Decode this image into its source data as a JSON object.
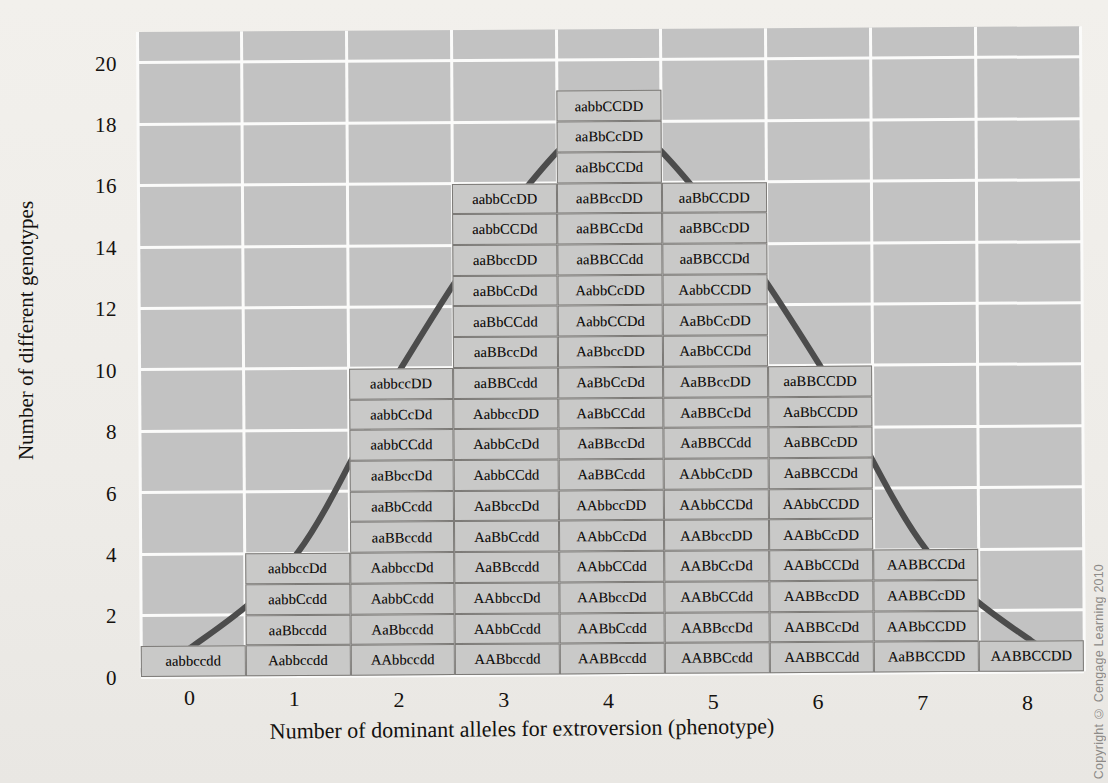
{
  "chart_data": {
    "type": "bar",
    "title": "",
    "xlabel": "Number of dominant alleles for extroversion (phenotype)",
    "ylabel": "Number of different genotypes",
    "categories": [
      "0",
      "1",
      "2",
      "3",
      "4",
      "5",
      "6",
      "7",
      "8"
    ],
    "values": [
      1,
      4,
      10,
      15,
      18,
      15,
      10,
      4,
      1
    ],
    "ylim": [
      0,
      21
    ],
    "xlim": [
      -0.5,
      8.5
    ],
    "yticks": [
      "0",
      "2",
      "4",
      "6",
      "8",
      "10",
      "12",
      "14",
      "16",
      "18",
      "20"
    ],
    "ytick_values": [
      0,
      2,
      4,
      6,
      8,
      10,
      12,
      14,
      16,
      18,
      20
    ],
    "grid": true,
    "legend": null,
    "overlay": "normal-distribution-curve",
    "annotations": "Each cell in a stacked column is one genotype (4 gene loci A,B,C,D) producing that phenotype; stack height = number of different genotypes.",
    "columns": [
      {
        "x": "0",
        "count": 1,
        "genotypes": [
          "aabbccdd"
        ]
      },
      {
        "x": "1",
        "count": 4,
        "genotypes": [
          "Aabbccdd",
          "aaBbccdd",
          "aabbCcdd",
          "aabbccDd"
        ]
      },
      {
        "x": "2",
        "count": 10,
        "genotypes": [
          "AAbbccdd",
          "AaBbccdd",
          "AabbCcdd",
          "AabbccDd",
          "aaBBccdd",
          "aaBbCcdd",
          "aaBbccDd",
          "aabbCCdd",
          "aabbCcDd",
          "aabbccDD"
        ]
      },
      {
        "x": "3",
        "count": 15,
        "genotypes": [
          "AABbccdd",
          "AAbbCcdd",
          "AAbbccDd",
          "AaBBccdd",
          "AaBbCcdd",
          "AaBbccDd",
          "AabbCCdd",
          "AabbCcDd",
          "AabbccDD",
          "aaBBCcdd",
          "aaBBccDd",
          "aaBbCCdd",
          "aaBbCcDd",
          "aaBbccDD",
          "aabbCCDd",
          "aabbCcDD"
        ]
      },
      {
        "x": "4",
        "count": 18,
        "genotypes": [
          "AABBccdd",
          "AABbCcdd",
          "AABbccDd",
          "AAbbCCdd",
          "AAbbCcDd",
          "AAbbccDD",
          "AaBBCcdd",
          "AaBBccDd",
          "AaBbCCdd",
          "AaBbCcDd",
          "AaBbccDD",
          "AabbCCDd",
          "AabbCcDD",
          "aaBBCCdd",
          "aaBBCcDd",
          "aaBBccDD",
          "aaBbCCDd",
          "aaBbCcDD",
          "aabbCCDD"
        ]
      },
      {
        "x": "5",
        "count": 15,
        "genotypes": [
          "AABBCcdd",
          "AABBccDd",
          "AABbCCdd",
          "AABbCcDd",
          "AABbccDD",
          "AAbbCCDd",
          "AAbbCcDD",
          "AaBBCCdd",
          "AaBBCcDd",
          "AaBBccDD",
          "AaBbCCDd",
          "AaBbCcDD",
          "AabbCCDD",
          "aaBBCCDd",
          "aaBBCcDD",
          "aaBbCCDD"
        ]
      },
      {
        "x": "6",
        "count": 10,
        "genotypes": [
          "AABBCCdd",
          "AABBCcDd",
          "AABBccDD",
          "AABbCCDd",
          "AABbCcDD",
          "AAbbCCDD",
          "AaBBCCDd",
          "AaBBCcDD",
          "AaBbCCDD",
          "aaBBCCDD"
        ]
      },
      {
        "x": "7",
        "count": 4,
        "genotypes": [
          "AaBBCCDD",
          "AABbCCDD",
          "AABBCcDD",
          "AABBCCDd"
        ]
      },
      {
        "x": "8",
        "count": 1,
        "genotypes": [
          "AABBCCDD"
        ]
      }
    ]
  },
  "axes": {
    "y_title": "Number of different genotypes",
    "x_title": "Number of dominant alleles for extroversion (phenotype)",
    "y_ticks": [
      "0",
      "2",
      "4",
      "6",
      "8",
      "10",
      "12",
      "14",
      "16",
      "18",
      "20"
    ],
    "x_ticks": [
      "0",
      "1",
      "2",
      "3",
      "4",
      "5",
      "6",
      "7",
      "8"
    ]
  },
  "colors": {
    "plot_background": "#c2c2c2",
    "page_background": "#eceae6",
    "gridline": "#fbfbfa",
    "box_fill": "#c9c9c8",
    "box_border": "#7c7a77",
    "curve": "#4c4c4c",
    "text": "#15120f"
  },
  "footer": {
    "copyright": "Copyright © Cengage Learning 2010"
  }
}
